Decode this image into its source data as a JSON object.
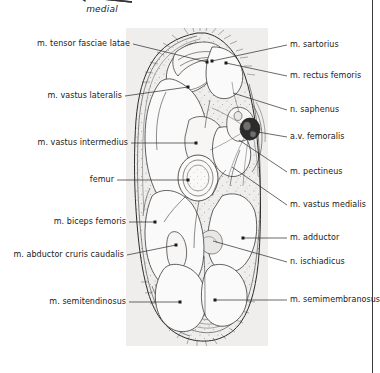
{
  "figure": {
    "orientation": {
      "label": "medial",
      "arrow_icon": "arrow-left-icon"
    },
    "panel": {
      "name": "anatomical-cross-section",
      "background_color": "#efeeec"
    },
    "colors": {
      "page_background": "#ffffff",
      "panel_background": "#efeeec",
      "leader_line": "#2a2a2a",
      "label_text": "#1a1a1a",
      "vessel_dark": "#2b2b2b",
      "outline": "#2f2f2f",
      "rule": "#3b3b3b"
    }
  },
  "labels_left": [
    {
      "text": "m. tensor fasciae latae",
      "x": 130,
      "y": 44
    },
    {
      "text": "m. vastus lateralis",
      "x": 122,
      "y": 96
    },
    {
      "text": "m. vastus intermedius",
      "x": 128,
      "y": 143
    },
    {
      "text": "femur",
      "x": 114,
      "y": 180
    },
    {
      "text": "m. biceps femoris",
      "x": 126,
      "y": 222
    },
    {
      "text": "m. abductor cruris  caudalis",
      "x": 124,
      "y": 255
    },
    {
      "text": "m. semitendinosus",
      "x": 126,
      "y": 302
    }
  ],
  "labels_right": [
    {
      "text": "m. sartorius",
      "x": 290,
      "y": 45
    },
    {
      "text": "m. rectus femoris",
      "x": 290,
      "y": 76
    },
    {
      "text": "n. saphenus",
      "x": 290,
      "y": 110
    },
    {
      "text": "a.v. femoralis",
      "x": 290,
      "y": 137
    },
    {
      "text": "m. pectineus",
      "x": 290,
      "y": 172
    },
    {
      "text": "m. vastus medialis",
      "x": 290,
      "y": 205
    },
    {
      "text": "m. adductor",
      "x": 290,
      "y": 238
    },
    {
      "text": "n. ischiadicus",
      "x": 290,
      "y": 262
    },
    {
      "text": "m. semimembranosus",
      "x": 290,
      "y": 300
    }
  ],
  "leaders_left": [
    {
      "name": "leader-tensor-fasciae-latae",
      "x1": 133,
      "y1": 44,
      "x2": 207,
      "y2": 62
    },
    {
      "name": "leader-vastus-lateralis",
      "x1": 125,
      "y1": 96,
      "x2": 188,
      "y2": 87
    },
    {
      "name": "leader-vastus-intermedius",
      "x1": 131,
      "y1": 143,
      "x2": 196,
      "y2": 143
    },
    {
      "name": "leader-femur",
      "x1": 117,
      "y1": 180,
      "x2": 188,
      "y2": 180
    },
    {
      "name": "leader-biceps-femoris",
      "x1": 129,
      "y1": 222,
      "x2": 155,
      "y2": 222
    },
    {
      "name": "leader-abductor-cruris-caudalis",
      "x1": 127,
      "y1": 255,
      "x2": 176,
      "y2": 245
    },
    {
      "name": "leader-semitendinosus",
      "x1": 129,
      "y1": 302,
      "x2": 180,
      "y2": 302
    }
  ],
  "leaders_right": [
    {
      "name": "leader-sartorius",
      "x1": 287,
      "y1": 45,
      "x2": 212,
      "y2": 61
    },
    {
      "name": "leader-rectus-femoris",
      "x1": 287,
      "y1": 76,
      "x2": 226,
      "y2": 63
    },
    {
      "name": "leader-saphenus",
      "x1": 287,
      "y1": 110,
      "x2": 233,
      "y2": 93
    },
    {
      "name": "leader-av-femoralis",
      "x1": 287,
      "y1": 137,
      "x2": 252,
      "y2": 131
    },
    {
      "name": "leader-pectineus",
      "x1": 287,
      "y1": 172,
      "x2": 239,
      "y2": 140
    },
    {
      "name": "leader-vastus-medialis",
      "x1": 287,
      "y1": 205,
      "x2": 232,
      "y2": 167
    },
    {
      "name": "leader-adductor",
      "x1": 287,
      "y1": 238,
      "x2": 243,
      "y2": 238
    },
    {
      "name": "leader-ischiadicus",
      "x1": 287,
      "y1": 262,
      "x2": 213,
      "y2": 241
    },
    {
      "name": "leader-semimembranosus",
      "x1": 287,
      "y1": 300,
      "x2": 215,
      "y2": 300
    }
  ],
  "leader_dots": [
    {
      "name": "dot-tensor-fasciae-latae",
      "x": 207,
      "y": 62
    },
    {
      "name": "dot-vastus-lateralis",
      "x": 188,
      "y": 87
    },
    {
      "name": "dot-vastus-intermedius",
      "x": 196,
      "y": 143
    },
    {
      "name": "dot-femur",
      "x": 188,
      "y": 180
    },
    {
      "name": "dot-biceps-femoris",
      "x": 155,
      "y": 222
    },
    {
      "name": "dot-semitendinosus",
      "x": 180,
      "y": 302
    },
    {
      "name": "dot-sartorius",
      "x": 212,
      "y": 61
    },
    {
      "name": "dot-rectus-femoris",
      "x": 226,
      "y": 63
    },
    {
      "name": "dot-adductor",
      "x": 243,
      "y": 238
    },
    {
      "name": "dot-semimembranosus",
      "x": 215,
      "y": 300
    },
    {
      "name": "dot-abductor-cruris",
      "x": 176,
      "y": 245
    }
  ]
}
